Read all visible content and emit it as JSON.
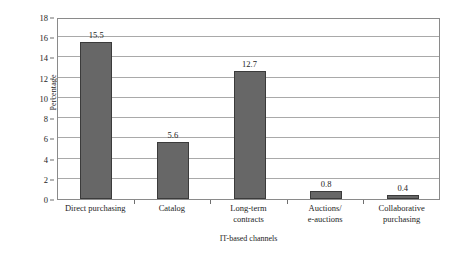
{
  "chart_data": {
    "type": "bar",
    "title": "",
    "xlabel": "IT-based channels",
    "ylabel": "Percentage",
    "categories": [
      "Direct purchasing",
      "Catalog",
      "Long-term contracts",
      "Auctions/ e-auctions",
      "Collaborative purchasing"
    ],
    "category_lines": [
      [
        "Direct purchasing"
      ],
      [
        "Catalog"
      ],
      [
        "Long-term",
        "contracts"
      ],
      [
        "Auctions/",
        "e-auctions"
      ],
      [
        "Collaborative",
        "purchasing"
      ]
    ],
    "values": [
      15.5,
      5.6,
      12.7,
      0.8,
      0.4
    ],
    "value_labels": [
      "15.5",
      "5.6",
      "12.7",
      "0.8",
      "0.4"
    ],
    "ylim": [
      0,
      18
    ],
    "yticks": [
      0,
      2,
      4,
      6,
      8,
      10,
      12,
      14,
      16,
      18
    ],
    "ytick_labels": [
      "0",
      "2",
      "4",
      "6",
      "8",
      "10",
      "12",
      "14",
      "16",
      "18"
    ],
    "grid": true,
    "legend": "none",
    "bar_color": "#676767",
    "bar_edge_color": "#3b3b3b",
    "grid_color": "#a9a9a9",
    "axis_color": "#8a8a8a"
  }
}
